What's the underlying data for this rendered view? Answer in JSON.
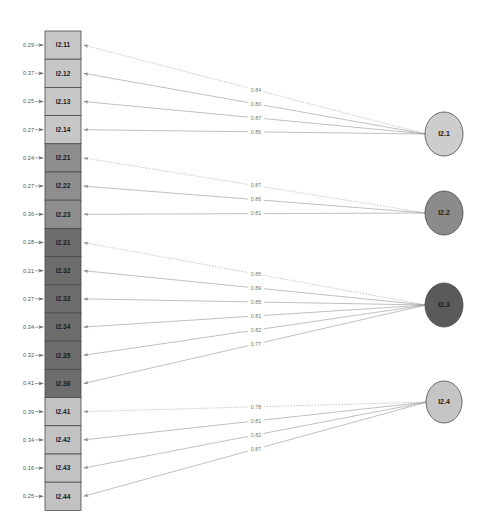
{
  "diagram": {
    "type": "sem-path-diagram",
    "canvas": {
      "width": 485,
      "height": 530
    },
    "background_color": "#ffffff"
  },
  "chart_data": {
    "type": "diagram",
    "title": "",
    "notation": "standardized factor loadings and residual variances",
    "factors": [
      {
        "id": "I2.1",
        "label": "I2.1",
        "fill": "#cdcdcd",
        "cx": 444,
        "cy": 134,
        "rx": 19,
        "ry": 22,
        "indicators": [
          {
            "label": "I2.11",
            "residual": "0.29",
            "loading": "0.84",
            "fill": "#c7c7c7",
            "style": "dashed"
          },
          {
            "label": "I2.12",
            "residual": "0.37",
            "loading": "0.80",
            "fill": "#c7c7c7",
            "style": "solid"
          },
          {
            "label": "I2.13",
            "residual": "0.25",
            "loading": "0.87",
            "fill": "#c7c7c7",
            "style": "solid"
          },
          {
            "label": "I2.14",
            "residual": "0.27",
            "loading": "0.86",
            "fill": "#c7c7c7",
            "style": "solid"
          }
        ]
      },
      {
        "id": "I2.2",
        "label": "I2.2",
        "fill": "#8a8a8a",
        "cx": 444,
        "cy": 213,
        "rx": 19,
        "ry": 22,
        "indicators": [
          {
            "label": "I2.21",
            "residual": "0.24",
            "loading": "0.87",
            "fill": "#8e8e8e",
            "style": "dashed"
          },
          {
            "label": "I2.22",
            "residual": "0.27",
            "loading": "0.86",
            "fill": "#8e8e8e",
            "style": "solid"
          },
          {
            "label": "I2.23",
            "residual": "0.36",
            "loading": "0.81",
            "fill": "#8e8e8e",
            "style": "solid"
          }
        ]
      },
      {
        "id": "I2.3",
        "label": "I2.3",
        "fill": "#5a5a5a",
        "cx": 444,
        "cy": 305,
        "rx": 19,
        "ry": 22,
        "indicators": [
          {
            "label": "I2.31",
            "residual": "0.28",
            "loading": "0.85",
            "fill": "#6d6d6d",
            "style": "dashed"
          },
          {
            "label": "I2.32",
            "residual": "0.21",
            "loading": "0.89",
            "fill": "#6d6d6d",
            "style": "solid"
          },
          {
            "label": "I2.33",
            "residual": "0.27",
            "loading": "0.85",
            "fill": "#6d6d6d",
            "style": "solid"
          },
          {
            "label": "I2.34",
            "residual": "0.34",
            "loading": "0.81",
            "fill": "#6d6d6d",
            "style": "solid"
          },
          {
            "label": "I2.35",
            "residual": "0.32",
            "loading": "0.82",
            "fill": "#6d6d6d",
            "style": "solid"
          },
          {
            "label": "I2.36",
            "residual": "0.41",
            "loading": "0.77",
            "fill": "#6d6d6d",
            "style": "solid"
          }
        ]
      },
      {
        "id": "I2.4",
        "label": "I2.4",
        "fill": "#c5c5c5",
        "cx": 444,
        "cy": 402,
        "rx": 18,
        "ry": 21,
        "indicators": [
          {
            "label": "I2.41",
            "residual": "0.39",
            "loading": "0.78",
            "fill": "#c2c2c2",
            "style": "dashed"
          },
          {
            "label": "I2.42",
            "residual": "0.34",
            "loading": "0.81",
            "fill": "#c2c2c2",
            "style": "solid"
          },
          {
            "label": "I2.43",
            "residual": "0.16",
            "loading": "0.82",
            "fill": "#c2c2c2",
            "style": "solid"
          },
          {
            "label": "I2.44",
            "residual": "0.25",
            "loading": "0.87",
            "fill": "#c2c2c2",
            "style": "solid"
          }
        ]
      }
    ],
    "indicator_order": [
      "I2.11",
      "I2.12",
      "I2.13",
      "I2.14",
      "I2.21",
      "I2.22",
      "I2.23",
      "I2.31",
      "I2.32",
      "I2.33",
      "I2.34",
      "I2.35",
      "I2.36",
      "I2.41",
      "I2.42",
      "I2.43",
      "I2.44"
    ],
    "residual_values": [
      "0.29",
      "0.37",
      "0.25",
      "0.27",
      "0.24",
      "0.27",
      "0.36",
      "0.28",
      "0.21",
      "0.27",
      "0.34",
      "0.32",
      "0.41",
      "0.39",
      "0.34",
      "0.16",
      "0.25"
    ],
    "loading_values": [
      "0.84",
      "0.80",
      "0.87",
      "0.86",
      "0.87",
      "0.86",
      "0.81",
      "0.85",
      "0.89",
      "0.85",
      "0.81",
      "0.82",
      "0.77",
      "0.78",
      "0.81",
      "0.82",
      "0.87"
    ],
    "layout": {
      "box_x": 45,
      "box_width": 36,
      "box_top": 31,
      "box_height": 28.2,
      "residual_label_x": 40,
      "loading_label_x": 256
    },
    "colors": {
      "edge": "#8c8c8c",
      "box_stroke": "#4a4a4a",
      "text": "#1a1a1a",
      "residual_text": "#555555",
      "loading_text": "#777777"
    }
  }
}
